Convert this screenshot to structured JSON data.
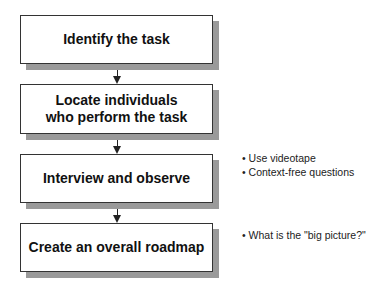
{
  "diagram": {
    "steps": [
      {
        "label": "Identify the task"
      },
      {
        "label": "Locate individuals\nwho perform the task"
      },
      {
        "label": "Interview and observe"
      },
      {
        "label": "Create an overall roadmap"
      }
    ],
    "notes": {
      "interview": [
        "• Use videotape",
        "• Context-free questions"
      ],
      "roadmap": [
        "• What is the \"big picture?\""
      ]
    }
  }
}
